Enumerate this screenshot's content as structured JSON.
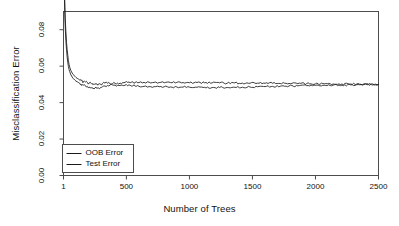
{
  "chart_data": {
    "type": "line",
    "title": "",
    "xlabel": "Number of Trees",
    "ylabel": "Misclassification Error",
    "xlim": [
      1,
      2500
    ],
    "ylim": [
      0.0,
      0.09
    ],
    "grid": false,
    "legend_position": "bottom-left",
    "xticks": [
      1,
      500,
      1000,
      1500,
      2000,
      2500
    ],
    "xtick_labels": [
      "1",
      "500",
      "1000",
      "1500",
      "2000",
      "2500"
    ],
    "yticks": [
      0.0,
      0.02,
      0.04,
      0.06,
      0.08
    ],
    "ytick_labels": [
      "0.00",
      "0.02",
      "0.04",
      "0.06",
      "0.08"
    ],
    "series": [
      {
        "name": "OOB Error",
        "color": "#1a1a1a",
        "x": [
          1,
          5,
          10,
          15,
          20,
          25,
          30,
          35,
          40,
          45,
          50,
          60,
          70,
          80,
          90,
          100,
          110,
          120,
          130,
          140,
          150,
          160,
          175,
          190,
          205,
          220,
          235,
          250,
          265,
          280,
          295,
          310,
          330,
          350,
          370,
          390,
          410,
          430,
          450,
          480,
          510,
          540,
          570,
          600,
          640,
          680,
          720,
          760,
          800,
          850,
          900,
          950,
          1000,
          1060,
          1120,
          1180,
          1240,
          1300,
          1360,
          1420,
          1480,
          1540,
          1600,
          1660,
          1720,
          1790,
          1860,
          1930,
          2000,
          2070,
          2140,
          2210,
          2280,
          2350,
          2420,
          2500
        ],
        "y": [
          0.142,
          0.118,
          0.098,
          0.086,
          0.079,
          0.073,
          0.069,
          0.066,
          0.063,
          0.061,
          0.0595,
          0.0575,
          0.0562,
          0.0553,
          0.0545,
          0.0538,
          0.0533,
          0.0529,
          0.0524,
          0.0521,
          0.0518,
          0.0516,
          0.0513,
          0.0511,
          0.0508,
          0.0506,
          0.0505,
          0.0504,
          0.0503,
          0.0503,
          0.0502,
          0.0505,
          0.0507,
          0.0506,
          0.0504,
          0.0503,
          0.0505,
          0.0507,
          0.0508,
          0.0509,
          0.0511,
          0.0512,
          0.0511,
          0.051,
          0.0511,
          0.0512,
          0.0511,
          0.051,
          0.0509,
          0.051,
          0.0511,
          0.051,
          0.0509,
          0.051,
          0.0509,
          0.0508,
          0.0508,
          0.0507,
          0.0508,
          0.0507,
          0.0506,
          0.0507,
          0.0506,
          0.0506,
          0.0505,
          0.0505,
          0.0504,
          0.0504,
          0.0503,
          0.0503,
          0.0502,
          0.0502,
          0.0502,
          0.0501,
          0.0501,
          0.05
        ]
      },
      {
        "name": "Test Error",
        "color": "#1a1a1a",
        "x": [
          1,
          5,
          10,
          15,
          20,
          25,
          30,
          35,
          40,
          45,
          50,
          60,
          70,
          80,
          90,
          100,
          110,
          120,
          130,
          140,
          150,
          160,
          175,
          190,
          205,
          220,
          235,
          250,
          265,
          280,
          295,
          310,
          330,
          350,
          370,
          390,
          410,
          430,
          450,
          480,
          510,
          540,
          570,
          600,
          640,
          680,
          720,
          760,
          800,
          850,
          900,
          950,
          1000,
          1060,
          1120,
          1180,
          1240,
          1300,
          1360,
          1420,
          1480,
          1540,
          1600,
          1660,
          1720,
          1790,
          1860,
          1930,
          2000,
          2070,
          2140,
          2210,
          2280,
          2350,
          2420,
          2500
        ],
        "y": [
          0.135,
          0.11,
          0.092,
          0.081,
          0.074,
          0.069,
          0.065,
          0.062,
          0.0598,
          0.0582,
          0.057,
          0.0552,
          0.054,
          0.0531,
          0.0524,
          0.0518,
          0.0514,
          0.051,
          0.0506,
          0.0502,
          0.0498,
          0.0496,
          0.0492,
          0.0489,
          0.0486,
          0.0483,
          0.0481,
          0.0479,
          0.0478,
          0.048,
          0.0483,
          0.0487,
          0.0491,
          0.0494,
          0.0496,
          0.0497,
          0.0496,
          0.0495,
          0.0494,
          0.0493,
          0.0492,
          0.0491,
          0.049,
          0.0489,
          0.0489,
          0.0488,
          0.0488,
          0.0487,
          0.0487,
          0.0486,
          0.0486,
          0.0485,
          0.0485,
          0.0484,
          0.0484,
          0.0483,
          0.0483,
          0.0483,
          0.0484,
          0.0485,
          0.0486,
          0.0487,
          0.0488,
          0.0489,
          0.049,
          0.0491,
          0.0492,
          0.0493,
          0.0494,
          0.0495,
          0.0496,
          0.0496,
          0.0497,
          0.0498,
          0.0499,
          0.05
        ]
      }
    ]
  },
  "legend": {
    "items": [
      {
        "label": "OOB Error"
      },
      {
        "label": "Test Error"
      }
    ]
  },
  "style": {
    "frame_color": "#4d4d4d",
    "line_color": "#1a1a1a",
    "background": "#ffffff"
  }
}
